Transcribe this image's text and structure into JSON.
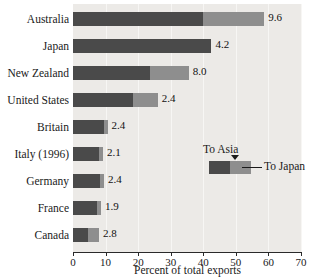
{
  "chart_data": {
    "type": "bar",
    "orientation": "horizontal",
    "stacked": true,
    "title": "",
    "xlabel": "Percent of total exports",
    "ylabel": "",
    "xlim": [
      0,
      70
    ],
    "xticks": [
      0,
      10,
      20,
      30,
      40,
      50,
      60,
      70
    ],
    "xtick_labels": [
      "0",
      "10",
      "20",
      "30",
      "40",
      "50",
      "60",
      "70"
    ],
    "grid": true,
    "legend_position": "inside-right",
    "categories": [
      "Australia",
      "Japan",
      "New Zealand",
      "United States",
      "Britain",
      "Italy (1996)",
      "Germany",
      "France",
      "Canada"
    ],
    "series": [
      {
        "name": "To Asia",
        "color": "#4a4a4a",
        "values": [
          40.0,
          42.5,
          23.5,
          18.3,
          9.4,
          8.0,
          8.3,
          7.4,
          4.5
        ]
      },
      {
        "name": "To Japan",
        "color": "#8e8e8e",
        "values": [
          18.7,
          0.0,
          12.0,
          7.7,
          1.2,
          1.2,
          1.2,
          1.2,
          3.5
        ]
      }
    ],
    "totals": [
      58.7,
      42.5,
      35.5,
      26.0,
      10.6,
      9.2,
      9.5,
      8.6,
      8.0
    ],
    "data_labels": [
      "9.6",
      "4.2",
      "8.0",
      "2.4",
      "2.4",
      "2.1",
      "2.4",
      "1.9",
      "2.8"
    ],
    "annotations": []
  },
  "legend": {
    "asia_label": "To Asia",
    "japan_label": "To Japan"
  },
  "axis": {
    "title": "Percent of total exports"
  }
}
